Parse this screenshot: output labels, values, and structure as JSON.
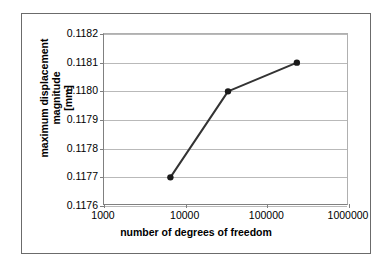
{
  "chart_data": {
    "type": "line",
    "title": "",
    "xlabel": "number of degrees of freedom",
    "ylabel_line1": "maximum displacement magnitude",
    "ylabel_line2": "[mm]",
    "xscale": "log",
    "yscale": "linear",
    "xlim": [
      1000,
      1000000
    ],
    "ylim": [
      0.1176,
      0.1182
    ],
    "grid": true,
    "legend": "none",
    "xticks": [
      1000,
      10000,
      100000,
      1000000
    ],
    "xtick_labels": [
      "1000",
      "10000",
      "100000",
      "1000000"
    ],
    "yticks": [
      0.1176,
      0.1177,
      0.1178,
      0.1179,
      0.118,
      0.1181,
      0.1182
    ],
    "ytick_labels": [
      "0.1176",
      "0.1177",
      "0.1178",
      "0.1179",
      "0.1180",
      "0.1181",
      "0.1182"
    ],
    "series": [
      {
        "name": "maximum displacement magnitude",
        "marker": "circle",
        "color": "#333333",
        "x": [
          6500,
          33000,
          230000
        ],
        "y": [
          0.1177,
          0.118,
          0.1181
        ]
      }
    ]
  },
  "style": {
    "line_color": "#333333",
    "marker_color": "#1a1a1a",
    "grid_color": "#b9b9b9",
    "axis_color": "#808080",
    "frame_color": "#6b6b6b",
    "background": "#ffffff"
  }
}
